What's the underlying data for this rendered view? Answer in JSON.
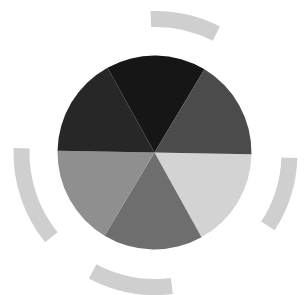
{
  "figure": {
    "width": 305,
    "height": 295,
    "background": "#ffffff",
    "pie": {
      "cx": 154.5,
      "cy": 152.5,
      "r": 97,
      "slices": [
        {
          "id": "lower-right",
          "start": 1,
          "end": 61,
          "color": "#d3d3d3"
        },
        {
          "id": "bottom",
          "start": 61,
          "end": 121,
          "color": "#6e6e6e"
        },
        {
          "id": "lower-left",
          "start": 121,
          "end": 181,
          "color": "#8f8f8f"
        },
        {
          "id": "upper-left",
          "start": 181,
          "end": 241,
          "color": "#272727"
        },
        {
          "id": "top",
          "start": 241,
          "end": 301,
          "color": "#161616"
        },
        {
          "id": "upper-right",
          "start": 301,
          "end": 361,
          "color": "#4b4b4b"
        }
      ]
    },
    "rings": {
      "cx": 155.5,
      "cy": 153,
      "r_inner": 126,
      "r_outer": 142,
      "color": "#cfcfcf",
      "arcs": [
        {
          "id": "arc-top",
          "start": 268,
          "end": 297
        },
        {
          "id": "arc-right",
          "start": 2,
          "end": 33
        },
        {
          "id": "arc-bottom",
          "start": 83,
          "end": 118
        },
        {
          "id": "arc-left",
          "start": 141,
          "end": 182
        }
      ]
    }
  }
}
